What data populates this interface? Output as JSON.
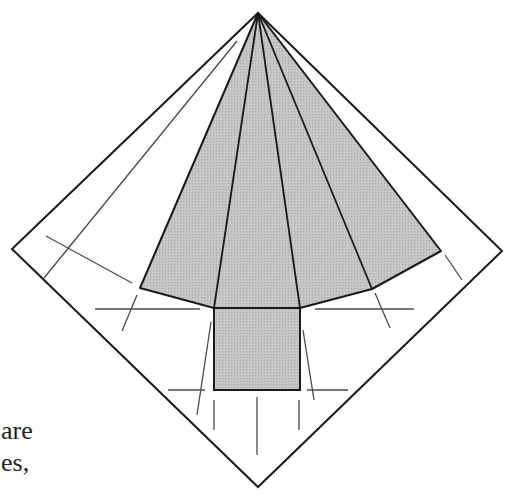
{
  "figure": {
    "colors": {
      "fill": "#bdbdbd",
      "outline": "#1a1a1a",
      "crease": "#4a4a4a",
      "background": "#ffffff"
    }
  },
  "caption": {
    "line1": "are",
    "line2": "es,"
  }
}
